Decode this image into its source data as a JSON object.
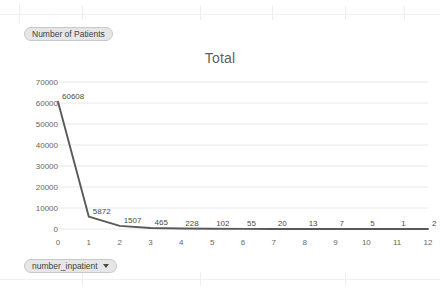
{
  "shelves": {
    "measure": {
      "label": "Number of Patients",
      "icon": "measure-pill"
    },
    "dimension": {
      "label": "number_inpatient",
      "icon": "chevron-down-icon"
    }
  },
  "chart_data": {
    "type": "line",
    "title": "Total",
    "xlabel": "",
    "ylabel": "",
    "x": [
      0,
      1,
      2,
      3,
      4,
      5,
      6,
      7,
      8,
      9,
      10,
      11,
      12
    ],
    "values": [
      60608,
      5872,
      1507,
      465,
      228,
      102,
      55,
      20,
      13,
      7,
      5,
      1,
      2
    ],
    "point_labels": [
      "60608",
      "5872",
      "1507",
      "465",
      "228",
      "102",
      "55",
      "20",
      "13",
      "7",
      "5",
      "1",
      "2"
    ],
    "xticks": [
      "0",
      "1",
      "2",
      "3",
      "4",
      "5",
      "6",
      "7",
      "8",
      "9",
      "10",
      "11",
      "12"
    ],
    "yticks": [
      "0",
      "10000",
      "20000",
      "30000",
      "40000",
      "50000",
      "60000",
      "70000"
    ],
    "ytick_values": [
      0,
      10000,
      20000,
      30000,
      40000,
      50000,
      60000,
      70000
    ],
    "xlim": [
      0,
      12
    ],
    "ylim": [
      0,
      70000
    ],
    "grid": "horizontal",
    "legend": "none",
    "line_color": "#595959",
    "series_name": "Number of Patients"
  },
  "colors": {
    "line": "#595959",
    "gridline": "#e8e8e8",
    "text": "#666666",
    "title": "#5f5f5f",
    "pill_bg": "#e6e6e6",
    "pill_border": "#c8c8c8",
    "background": "#ffffff"
  }
}
